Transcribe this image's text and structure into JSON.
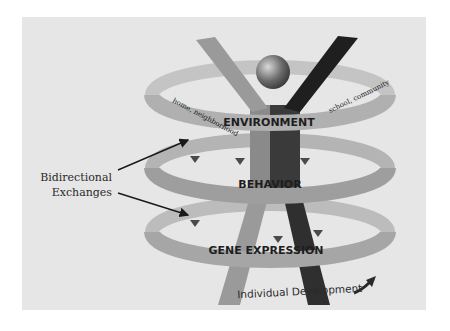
{
  "diagram": {
    "rings": [
      {
        "label": "ENVIRONMENT",
        "sub_left": "home, neighborhood",
        "sub_right": "school, community"
      },
      {
        "label": "BEHAVIOR"
      },
      {
        "label": "GENE EXPRESSION"
      }
    ],
    "callout": {
      "line1": "Bidirectional",
      "line2": "Exchanges"
    },
    "axis_label": "Individual Development",
    "colors": {
      "panel": "#e6e6e6",
      "ring": "#a8a8a8",
      "ring_dark": "#8e8e8e",
      "figure_light": "#9a9a9a",
      "figure_dark": "#2f2f2f",
      "arrow": "#555555"
    }
  }
}
